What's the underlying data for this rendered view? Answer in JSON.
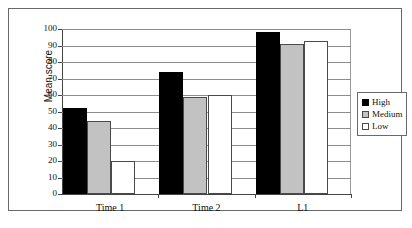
{
  "chart_data": {
    "type": "bar",
    "title": "",
    "subtitle": "",
    "xlabel": "",
    "ylabel": "Mean score",
    "categories": [
      "Time 1",
      "Time 2",
      "L1"
    ],
    "series": [
      {
        "name": "High",
        "color": "#000000",
        "values": [
          52,
          74,
          98
        ]
      },
      {
        "name": "Medium",
        "color": "#c2c2c2",
        "values": [
          44,
          59,
          91
        ]
      },
      {
        "name": "Low",
        "color": "#ffffff",
        "values": [
          20,
          60,
          93
        ]
      }
    ],
    "ylim": [
      0,
      100
    ],
    "ytick_values": [
      0,
      10,
      20,
      30,
      40,
      50,
      60,
      70,
      80,
      90,
      100
    ],
    "ytick_labels": [
      "0",
      "10",
      "20",
      "30",
      "40",
      "50",
      "60",
      "70",
      "80",
      "90",
      "100"
    ],
    "grid": true,
    "grid_axis": "y",
    "legend_position": "right",
    "legend_entries": [
      "High",
      "Medium",
      "Low"
    ]
  },
  "axis": {
    "y_title": "Mean score"
  },
  "legend": {
    "items": [
      {
        "label": "High"
      },
      {
        "label": "Medium"
      },
      {
        "label": "Low"
      }
    ]
  },
  "caption": {
    "text": ""
  }
}
